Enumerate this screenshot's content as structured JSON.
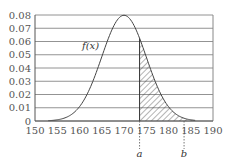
{
  "chart_data": {
    "type": "area",
    "title": "",
    "xlabel": "",
    "ylabel": "",
    "curve_label": "f(x)",
    "distribution": {
      "kind": "normal",
      "mean": 170,
      "sd": 5
    },
    "xlim": [
      150,
      190
    ],
    "ylim": [
      0,
      0.08
    ],
    "x_ticks": [
      "150",
      "155",
      "160",
      "165",
      "170",
      "175",
      "180",
      "185",
      "190"
    ],
    "y_ticks": [
      "0",
      "0.01",
      "0.02",
      "0.03",
      "0.04",
      "0.05",
      "0.06",
      "0.07",
      "0.08"
    ],
    "grid": {
      "horizontal": true,
      "vertical": false
    },
    "shaded_region": {
      "from": 173.5,
      "to": 190,
      "style": "hatched"
    },
    "markers": [
      {
        "label": "a",
        "x": 173.5
      },
      {
        "label": "b",
        "x": 183.5
      }
    ]
  }
}
